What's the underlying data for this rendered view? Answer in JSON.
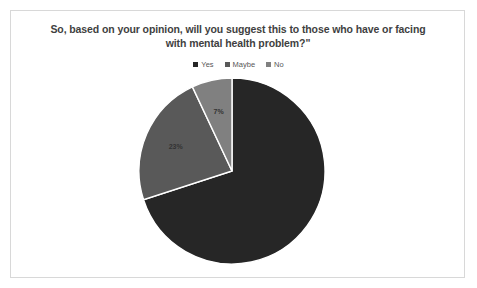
{
  "chart_data": {
    "type": "pie",
    "title": "So, based on your opinion, will you suggest this to those who have or facing with mental health problem?\"",
    "title_line1": "So, based on your opinion, will you suggest this to those who have or facing",
    "title_line2": "with mental health problem?\"",
    "categories": [
      "Yes",
      "Maybe",
      "No"
    ],
    "values": [
      70,
      23,
      7
    ],
    "value_labels": [
      "70%",
      "23%",
      "7%"
    ],
    "colors": [
      "#262626",
      "#595959",
      "#808080"
    ],
    "legend_position": "top",
    "labels_shown": [
      "23%",
      "7%"
    ],
    "start_angle": 0,
    "direction": "clockwise",
    "xlabel": "",
    "ylabel": ""
  },
  "legend": {
    "items": [
      {
        "label": "Yes",
        "color": "#262626"
      },
      {
        "label": "Maybe",
        "color": "#595959"
      },
      {
        "label": "No",
        "color": "#808080"
      }
    ]
  },
  "labels": {
    "maybe_pct": "23%",
    "no_pct": "7%",
    "yes_pct": "70%"
  }
}
